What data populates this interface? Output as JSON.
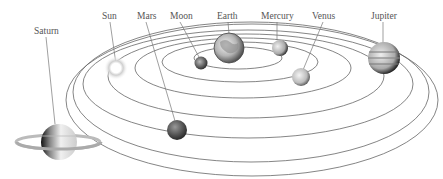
{
  "diagram": {
    "type": "solar-system",
    "labels": {
      "saturn": "Saturn",
      "sun": "Sun",
      "mars": "Mars",
      "moon": "Moon",
      "earth": "Earth",
      "mercury": "Mercury",
      "venus": "Venus",
      "jupiter": "Jupiter"
    },
    "colors": {
      "background": "#ffffff",
      "orbit": "#666666",
      "label": "#555555",
      "sun_glow": "#d8d8d8"
    }
  }
}
